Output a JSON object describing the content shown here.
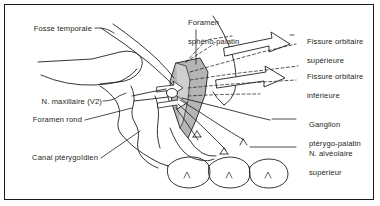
{
  "figure": {
    "style": "anatomical line drawing",
    "frame_color": "#1a1a1a",
    "ink_color": "#231f20",
    "shade_color": "#b3b3b3",
    "background": "#ffffff"
  },
  "labels": {
    "fosse_temporale": "Fosse temporale",
    "n_maxillaire": "N. maxillaire (V2)",
    "foramen_rond": "Foramen rond",
    "canal_pterygoidien": "Canal ptérygoïdien",
    "foramen_spheno_palatin_l1": "Foramen",
    "foramen_spheno_palatin_l2": "sphéno-palatin",
    "fissure_orbitaire_sup_l1": "Fissure orbitaire",
    "fissure_orbitaire_sup_l2": "supérieure",
    "fissure_orbitaire_inf_l1": "Fissure orbitaire",
    "fissure_orbitaire_inf_l2": "inférieure",
    "ganglion_l1": "Ganglion",
    "ganglion_l2": "ptérygo-palatin",
    "n_alveolaire_l1": "N. alvéolaire",
    "n_alveolaire_l2": "supérieur"
  },
  "structures": [
    {
      "name": "zygomatic-arch",
      "side": "left"
    },
    {
      "name": "maxilla-outline",
      "side": "center"
    },
    {
      "name": "pterygopalatine-fossa-wedge",
      "shaded": true
    },
    {
      "name": "orbit-outline",
      "side": "right"
    },
    {
      "name": "molar-teeth",
      "count": 3
    },
    {
      "name": "superior-orbital-fissure-arrow"
    },
    {
      "name": "inferior-orbital-fissure-arrow"
    },
    {
      "name": "sphenopalatine-foramen-arrow"
    },
    {
      "name": "nerve-branches"
    }
  ]
}
